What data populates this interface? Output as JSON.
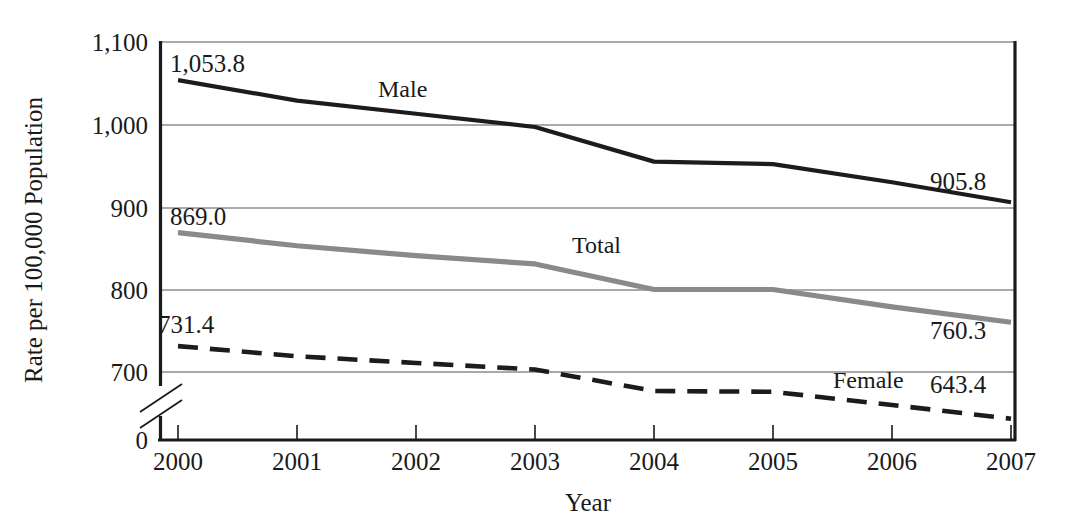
{
  "chart_data": {
    "type": "line",
    "title": "",
    "xlabel": "Year",
    "ylabel": "Rate per 100,000 Population",
    "x": [
      2000,
      2001,
      2002,
      2003,
      2004,
      2005,
      2006,
      2007
    ],
    "categories": [
      "2000",
      "2001",
      "2002",
      "2003",
      "2004",
      "2005",
      "2006",
      "2007"
    ],
    "series": [
      {
        "name": "Male",
        "style": "solid-black",
        "color": "#1c1c1c",
        "values": [
          1053.8,
          1029.0,
          1013.0,
          997.0,
          955.0,
          952.0,
          930.0,
          905.8
        ],
        "start_label": "1,053.8",
        "end_label": "905.8",
        "inline_label": "Male"
      },
      {
        "name": "Total",
        "style": "solid-gray",
        "color": "#8a8a8a",
        "values": [
          869.0,
          853.0,
          841.0,
          831.0,
          800.0,
          800.0,
          779.0,
          760.3
        ],
        "start_label": "869.0",
        "end_label": "760.3",
        "inline_label": "Total"
      },
      {
        "name": "Female",
        "style": "dashed-black",
        "color": "#1c1c1c",
        "values": [
          731.4,
          719.0,
          711.0,
          703.0,
          677.0,
          676.0,
          660.0,
          643.4
        ],
        "start_label": "731.4",
        "end_label": "643.4",
        "inline_label": "Female"
      }
    ],
    "ytick_labels": [
      "1,100",
      "1,000",
      "900",
      "800",
      "700",
      "0"
    ],
    "ytick_values": [
      1100,
      1000,
      900,
      800,
      700,
      0
    ],
    "ylim": [
      700,
      1100
    ],
    "axis_break": true,
    "axis_break_note": "y-axis broken between 0 and 700",
    "grid": true,
    "grid_axis": "y",
    "legend_position": "inline-labels"
  },
  "labels": {
    "y_axis_title": "Rate per 100,000 Population",
    "x_axis_title": "Year",
    "y_ticks": [
      "1,100",
      "1,000",
      "900",
      "800",
      "700",
      "0"
    ],
    "x_ticks": [
      "2000",
      "2001",
      "2002",
      "2003",
      "2004",
      "2005",
      "2006",
      "2007"
    ],
    "male_name": "Male",
    "total_name": "Total",
    "female_name": "Female",
    "male_start": "1,053.8",
    "male_end": "905.8",
    "total_start": "869.0",
    "total_end": "760.3",
    "female_start": "731.4",
    "female_end": "643.4"
  },
  "colors": {
    "male": "#1c1c1c",
    "total": "#8a8a8a",
    "female": "#1c1c1c",
    "grid": "#555555",
    "axis": "#1a1a1a",
    "background": "#ffffff"
  }
}
